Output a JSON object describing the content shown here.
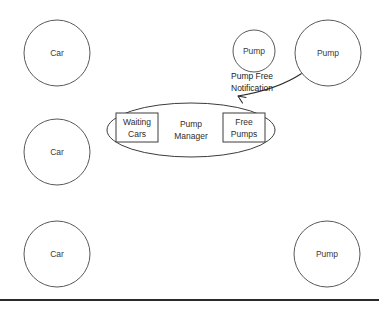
{
  "diagram": {
    "colors": {
      "background": "#ffffff",
      "circle_stroke": "#595959",
      "box_stroke": "#3c3c3c",
      "text": "#2e2e2e",
      "connector": "#2b2b2b",
      "rule": "#2a2a2a"
    },
    "cars": [
      {
        "label": "Car",
        "cx": 57,
        "cy": 53,
        "r": 33
      },
      {
        "label": "Car",
        "cx": 57,
        "cy": 152,
        "r": 33
      },
      {
        "label": "Car",
        "cx": 57,
        "cy": 254,
        "r": 33
      }
    ],
    "pumps": [
      {
        "label": "Pump",
        "cx": 254,
        "cy": 51,
        "r": 21
      },
      {
        "label": "Pump",
        "cx": 328,
        "cy": 53,
        "r": 33
      },
      {
        "label": "Pump",
        "cx": 327,
        "cy": 254,
        "r": 33
      }
    ],
    "manager": {
      "center_label_line1": "Pump",
      "center_label_line2": "Manager",
      "ellipse": {
        "cx": 191,
        "cy": 130,
        "rx": 84,
        "ry": 27
      },
      "boxes": [
        {
          "name": "waiting-cars",
          "line1": "Waiting",
          "line2": "Cars",
          "x": 116,
          "y": 113,
          "w": 42,
          "h": 29
        },
        {
          "name": "free-pumps",
          "line1": "Free",
          "line2": "Pumps",
          "x": 223,
          "y": 113,
          "w": 42,
          "h": 29
        }
      ]
    },
    "annotation": {
      "line1": "Pump Free",
      "line2": "Notification",
      "x": 231,
      "y1": 79,
      "y2": 91
    },
    "footer_rule": {
      "x": 0,
      "y": 299,
      "w": 379,
      "h": 2
    }
  }
}
